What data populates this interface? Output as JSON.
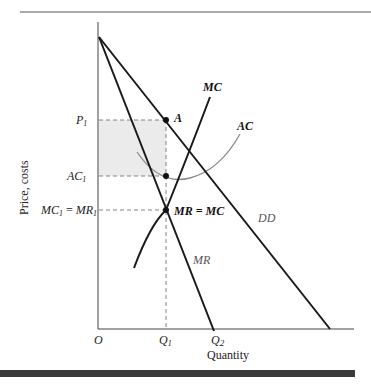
{
  "figure": {
    "y_axis_title": "Price, costs",
    "x_axis_title": "Quantity",
    "y_ticks": [
      {
        "label": "P",
        "sub": "1",
        "y": 120
      },
      {
        "label": "AC",
        "sub": "1",
        "y": 176
      },
      {
        "label": "MC",
        "sub": "1",
        "eq": " = ",
        "label2": "MR",
        "sub2": "1",
        "y": 210
      }
    ],
    "x_ticks": [
      {
        "label": "O",
        "x": 98
      },
      {
        "label": "Q",
        "sub": "1",
        "x": 166
      },
      {
        "label": "Q",
        "sub": "2",
        "x": 214
      }
    ],
    "curves": {
      "dd": "DD",
      "mr": "MR",
      "mc": "MC",
      "ac": "AC"
    },
    "points": {
      "a": "A",
      "mr_eq_mc": "MR = MC"
    },
    "colors": {
      "line": "#1a1a1a",
      "ac_curve": "#8a8a8a",
      "profit_area": "#ebebeb",
      "bottom_bar": "#3a3a3a"
    }
  }
}
